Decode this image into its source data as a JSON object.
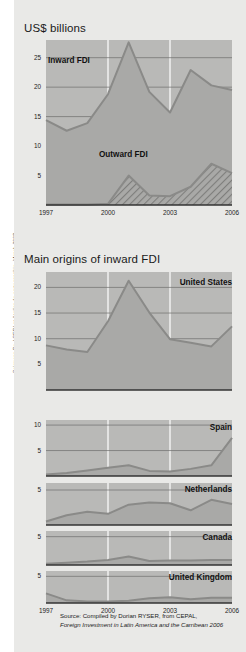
{
  "credit": "Sciences Po / CERI et Atelier de cartographie, March 2008",
  "titles": {
    "main": "US$ billions",
    "origins": "Main origins of inward FDI"
  },
  "source": {
    "line1": "Source: Compiled by Dorian RYSER, from CEPAL,",
    "line2": "Foreign Investment in Latin America and the Carribean 2006"
  },
  "colors": {
    "background": "#e9e9e7",
    "plot_fill": "#b9b9b7",
    "area_fill": "#a9a9a7",
    "line": "#8a8a88",
    "axis": "#333333",
    "grid": "#6f6f6d",
    "hatch": "#9a9a98"
  },
  "chart_data": [
    {
      "type": "area",
      "title": "US$ billions",
      "xlabel": "",
      "ylabel": "US$ billions",
      "x": [
        1997,
        1998,
        1999,
        2000,
        2001,
        2002,
        2003,
        2004,
        2005,
        2006
      ],
      "xticks": [
        "1997",
        "2000",
        "2003",
        "2006"
      ],
      "yticks": [
        5,
        10,
        15,
        20,
        25
      ],
      "ylim": [
        0,
        28
      ],
      "grid": true,
      "legend": "inline",
      "series": [
        {
          "name": "Inward FDI",
          "values": [
            14.4,
            12.6,
            13.9,
            18.8,
            27.6,
            19.2,
            15.7,
            22.9,
            20.3,
            19.5
          ]
        },
        {
          "name": "Outward FDI",
          "values": [
            0.1,
            0.1,
            0.1,
            0.2,
            5.0,
            1.6,
            1.5,
            3.1,
            7.0,
            5.4
          ]
        }
      ]
    },
    {
      "type": "area",
      "title": "United States",
      "xlabel": "",
      "ylabel": "",
      "x": [
        1997,
        1998,
        1999,
        2000,
        2001,
        2002,
        2003,
        2004,
        2005,
        2006
      ],
      "xticks": [
        "1997",
        "2000",
        "2003",
        "2006"
      ],
      "yticks": [
        5,
        10,
        15,
        20
      ],
      "ylim": [
        0,
        23
      ],
      "grid": true,
      "series": [
        {
          "name": "United States",
          "values": [
            8.7,
            7.9,
            7.4,
            13.4,
            21.3,
            15.1,
            9.9,
            9.2,
            8.5,
            12.4
          ]
        }
      ]
    },
    {
      "type": "area",
      "title": "Spain",
      "xlabel": "",
      "ylabel": "",
      "x": [
        1997,
        1998,
        1999,
        2000,
        2001,
        2002,
        2003,
        2004,
        2005,
        2006
      ],
      "xticks": [
        "1997",
        "2000",
        "2003",
        "2006"
      ],
      "yticks": [
        5,
        10
      ],
      "ylim": [
        0,
        11
      ],
      "grid": true,
      "series": [
        {
          "name": "Spain",
          "values": [
            0.3,
            0.6,
            1.1,
            1.6,
            2.1,
            1.0,
            0.9,
            1.4,
            2.1,
            7.5
          ]
        }
      ]
    },
    {
      "type": "area",
      "title": "Netherlands",
      "xlabel": "",
      "ylabel": "",
      "x": [
        1997,
        1998,
        1999,
        2000,
        2001,
        2002,
        2003,
        2004,
        2005,
        2006
      ],
      "xticks": [
        "1997",
        "2000",
        "2003",
        "2006"
      ],
      "yticks": [
        5
      ],
      "ylim": [
        0,
        6
      ],
      "grid": true,
      "series": [
        {
          "name": "Netherlands",
          "values": [
            0.5,
            1.4,
            1.9,
            1.6,
            2.9,
            3.2,
            3.1,
            2.1,
            3.6,
            3.0
          ]
        }
      ]
    },
    {
      "type": "area",
      "title": "Canada",
      "xlabel": "",
      "ylabel": "",
      "x": [
        1997,
        1998,
        1999,
        2000,
        2001,
        2002,
        2003,
        2004,
        2005,
        2006
      ],
      "xticks": [
        "1997",
        "2000",
        "2003",
        "2006"
      ],
      "yticks": [
        5
      ],
      "ylim": [
        0,
        6
      ],
      "grid": true,
      "series": [
        {
          "name": "Canada",
          "values": [
            0.2,
            0.4,
            0.6,
            0.9,
            1.5,
            0.7,
            0.8,
            0.8,
            0.9,
            0.9
          ]
        }
      ]
    },
    {
      "type": "area",
      "title": "United Kingdom",
      "xlabel": "",
      "ylabel": "",
      "x": [
        1997,
        1998,
        1999,
        2000,
        2001,
        2002,
        2003,
        2004,
        2005,
        2006
      ],
      "xticks": [
        "1997",
        "2000",
        "2003",
        "2006"
      ],
      "yticks": [
        5
      ],
      "ylim": [
        0,
        6
      ],
      "grid": true,
      "series": [
        {
          "name": "United Kingdom",
          "values": [
            1.8,
            0.5,
            0.3,
            0.3,
            0.4,
            0.9,
            1.1,
            0.7,
            1.0,
            1.0
          ]
        }
      ]
    }
  ]
}
